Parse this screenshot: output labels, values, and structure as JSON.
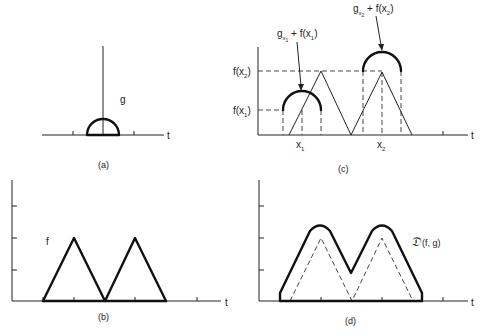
{
  "figure": {
    "panels": [
      {
        "id": "a",
        "caption": "(a)",
        "axis_label": "t",
        "curve_label": "g",
        "description": "structuring function g: semicircle centered at origin"
      },
      {
        "id": "b",
        "caption": "(b)",
        "axis_label": "t",
        "curve_label": "f",
        "description": "function f: two adjacent triangles"
      },
      {
        "id": "c",
        "caption": "(c)",
        "axis_label": "t",
        "x_labels": [
          "x",
          "x"
        ],
        "x_label_subscripts": [
          "1",
          "2"
        ],
        "y_labels": [
          "f(x",
          "f(x"
        ],
        "y_label_subscripts": [
          "2",
          "1"
        ],
        "y_label_suffix": ")",
        "annotation_1": {
          "g": "g",
          "sub": "x",
          "subsub": "1",
          "rest": " + f(x",
          "restsub": "1",
          "close": ")"
        },
        "annotation_2": {
          "g": "g",
          "sub": "x",
          "subsub": "2",
          "rest": " + f(x",
          "restsub": "2",
          "close": ")"
        }
      },
      {
        "id": "d",
        "caption": "(d)",
        "axis_label": "t",
        "curve_label_symbol": "𝔇",
        "curve_label_args": "(f, g)",
        "description": "dilation of f by g (solid) over f (dashed)"
      }
    ]
  }
}
